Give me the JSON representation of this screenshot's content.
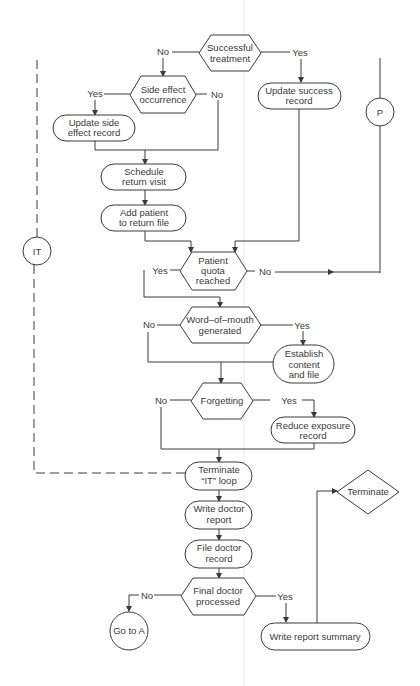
{
  "diagram": {
    "type": "flowchart",
    "nodes": {
      "successful_treatment": {
        "kind": "decision",
        "lines": [
          "Successful",
          "treatment"
        ]
      },
      "side_effect_occurrence": {
        "kind": "decision",
        "lines": [
          "Side effect",
          "occurrence"
        ]
      },
      "update_side_effect_record": {
        "kind": "process",
        "lines": [
          "Update side",
          "effect record"
        ]
      },
      "update_success_record": {
        "kind": "process",
        "lines": [
          "Update success",
          "record"
        ]
      },
      "connector_p": {
        "kind": "connector",
        "label": "P"
      },
      "schedule_return_visit": {
        "kind": "process",
        "lines": [
          "Schedule",
          "return visit"
        ]
      },
      "add_patient_to_return_file": {
        "kind": "process",
        "lines": [
          "Add patient",
          "to return file"
        ]
      },
      "connector_it": {
        "kind": "connector",
        "label": "IT"
      },
      "patient_quota_reached": {
        "kind": "decision",
        "lines": [
          "Patient",
          "quota",
          "reached"
        ]
      },
      "word_of_mouth_generated": {
        "kind": "decision",
        "lines": [
          "Word–of–mouth",
          "generated"
        ]
      },
      "establish_content_and_file": {
        "kind": "process",
        "lines": [
          "Establish",
          "content",
          "and file"
        ]
      },
      "forgetting": {
        "kind": "decision",
        "lines": [
          "Forgetting"
        ]
      },
      "reduce_exposure_record": {
        "kind": "process",
        "lines": [
          "Reduce exposure",
          "record"
        ]
      },
      "terminate_it_loop": {
        "kind": "process",
        "lines": [
          "Terminate",
          "“IT” loop"
        ]
      },
      "write_doctor_report": {
        "kind": "process",
        "lines": [
          "Write doctor",
          "report"
        ]
      },
      "file_doctor_record": {
        "kind": "process",
        "lines": [
          "File doctor",
          "record"
        ]
      },
      "final_doctor_processed": {
        "kind": "decision",
        "lines": [
          "Final doctor",
          "processed"
        ]
      },
      "go_to_a": {
        "kind": "connector",
        "label": "Go to A"
      },
      "write_report_summary": {
        "kind": "process",
        "lines": [
          "Write report summary"
        ]
      },
      "terminate": {
        "kind": "terminal-diamond",
        "lines": [
          "Terminate"
        ]
      }
    },
    "edge_labels": {
      "successful_treatment_no": "No",
      "successful_treatment_yes": "Yes",
      "side_effect_yes": "Yes",
      "side_effect_no": "No",
      "patient_quota_yes": "Yes",
      "patient_quota_no": "No",
      "word_of_mouth_no": "No",
      "word_of_mouth_yes": "Yes",
      "forgetting_no": "No",
      "forgetting_yes": "Yes",
      "final_doctor_no": "No",
      "final_doctor_yes": "Yes"
    },
    "edges": [
      {
        "from": "successful_treatment",
        "to": "side_effect_occurrence",
        "label": "No"
      },
      {
        "from": "successful_treatment",
        "to": "update_success_record",
        "label": "Yes"
      },
      {
        "from": "side_effect_occurrence",
        "to": "update_side_effect_record",
        "label": "Yes"
      },
      {
        "from": "side_effect_occurrence",
        "to": "schedule_return_visit",
        "label": "No"
      },
      {
        "from": "update_side_effect_record",
        "to": "schedule_return_visit"
      },
      {
        "from": "schedule_return_visit",
        "to": "add_patient_to_return_file"
      },
      {
        "from": "add_patient_to_return_file",
        "to": "patient_quota_reached"
      },
      {
        "from": "update_success_record",
        "to": "patient_quota_reached"
      },
      {
        "from": "patient_quota_reached",
        "to": "connector_p",
        "label": "No"
      },
      {
        "from": "patient_quota_reached",
        "to": "word_of_mouth_generated",
        "label": "Yes"
      },
      {
        "from": "word_of_mouth_generated",
        "to": "establish_content_and_file",
        "label": "Yes"
      },
      {
        "from": "word_of_mouth_generated",
        "to": "forgetting",
        "label": "No"
      },
      {
        "from": "establish_content_and_file",
        "to": "forgetting"
      },
      {
        "from": "forgetting",
        "to": "reduce_exposure_record",
        "label": "Yes"
      },
      {
        "from": "forgetting",
        "to": "terminate_it_loop",
        "label": "No"
      },
      {
        "from": "reduce_exposure_record",
        "to": "terminate_it_loop"
      },
      {
        "from": "terminate_it_loop",
        "to": "connector_it",
        "style": "dashed"
      },
      {
        "from": "terminate_it_loop",
        "to": "write_doctor_report"
      },
      {
        "from": "write_doctor_report",
        "to": "file_doctor_record"
      },
      {
        "from": "file_doctor_record",
        "to": "final_doctor_processed"
      },
      {
        "from": "final_doctor_processed",
        "to": "go_to_a",
        "label": "No"
      },
      {
        "from": "final_doctor_processed",
        "to": "write_report_summary",
        "label": "Yes"
      },
      {
        "from": "write_report_summary",
        "to": "terminate"
      }
    ]
  }
}
